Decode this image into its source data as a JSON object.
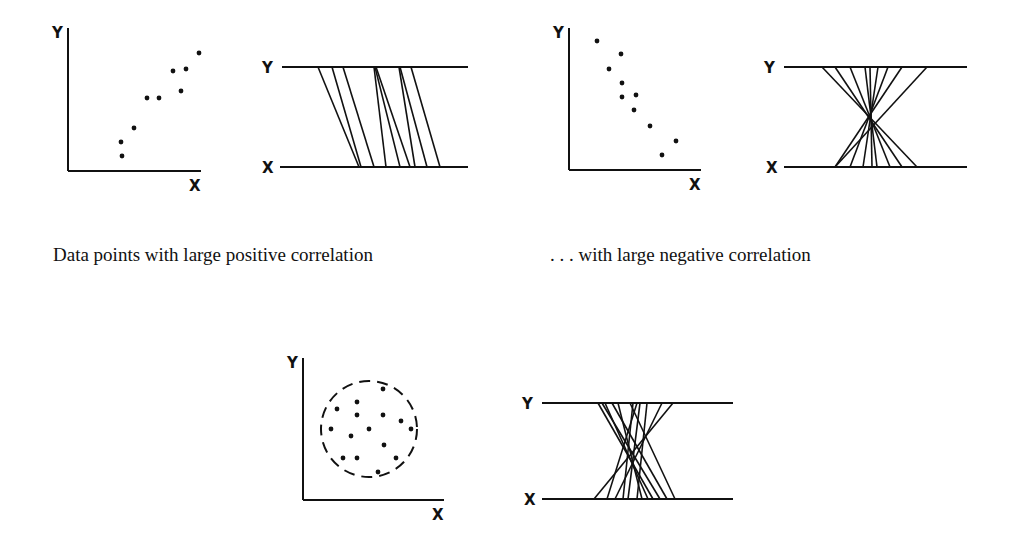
{
  "captions": {
    "positive": "Data points with large positive correlation",
    "negative": ". . . with large negative correlation"
  },
  "axis_labels": {
    "x": "X",
    "y": "Y"
  },
  "colors": {
    "ink": "#111111",
    "background": "#ffffff"
  },
  "panels": [
    {
      "id": "positive",
      "scatter": {
        "axis_origin": [
          68,
          171
        ],
        "y_top": 28,
        "x_right": 201,
        "points": [
          [
            121,
            142
          ],
          [
            122,
            156
          ],
          [
            134,
            128
          ],
          [
            147,
            98
          ],
          [
            159,
            98
          ],
          [
            173,
            71
          ],
          [
            186,
            69
          ],
          [
            181,
            91
          ],
          [
            199,
            53
          ]
        ]
      },
      "parallel": {
        "y_line": {
          "y": 67,
          "x1": 282,
          "x2": 468
        },
        "x_line": {
          "y": 167,
          "x1": 280,
          "x2": 468
        },
        "lines": [
          [
            318,
            359
          ],
          [
            332,
            361
          ],
          [
            343,
            374
          ],
          [
            374,
            386
          ],
          [
            376,
            410
          ],
          [
            375,
            400
          ],
          [
            399,
            415
          ],
          [
            400,
            427
          ],
          [
            411,
            440
          ]
        ]
      }
    },
    {
      "id": "negative",
      "scatter": {
        "axis_origin": [
          569,
          170
        ],
        "y_top": 28,
        "x_right": 701,
        "points": [
          [
            597,
            41
          ],
          [
            621,
            54
          ],
          [
            609,
            69
          ],
          [
            622,
            83
          ],
          [
            622,
            97
          ],
          [
            636,
            95
          ],
          [
            634,
            110
          ],
          [
            650,
            126
          ],
          [
            676,
            141
          ],
          [
            662,
            155
          ]
        ]
      },
      "parallel": {
        "y_line": {
          "y": 67,
          "x1": 784,
          "x2": 967
        },
        "x_line": {
          "y": 167,
          "x1": 784,
          "x2": 967
        },
        "lines": [
          [
            822,
            917
          ],
          [
            835,
            902
          ],
          [
            850,
            890
          ],
          [
            865,
            877
          ],
          [
            870,
            872
          ],
          [
            878,
            863
          ],
          [
            888,
            850
          ],
          [
            902,
            835
          ],
          [
            927,
            835
          ]
        ]
      }
    },
    {
      "id": "zero",
      "scatter": {
        "axis_origin": [
          303,
          500
        ],
        "y_top": 358,
        "x_right": 444,
        "circle": {
          "cx": 369,
          "cy": 429,
          "r": 48
        },
        "points": [
          [
            383,
            389
          ],
          [
            357,
            402
          ],
          [
            337,
            409
          ],
          [
            357,
            415
          ],
          [
            383,
            415
          ],
          [
            401,
            421
          ],
          [
            331,
            429
          ],
          [
            369,
            429
          ],
          [
            411,
            429
          ],
          [
            351,
            436
          ],
          [
            384,
            445
          ],
          [
            343,
            458
          ],
          [
            357,
            458
          ],
          [
            396,
            458
          ],
          [
            378,
            472
          ]
        ]
      },
      "parallel": {
        "y_line": {
          "y": 403,
          "x1": 542,
          "x2": 733
        },
        "x_line": {
          "y": 499,
          "x1": 542,
          "x2": 733
        },
        "lines": [
          [
            598,
            653
          ],
          [
            602,
            660
          ],
          [
            605,
            648
          ],
          [
            612,
            667
          ],
          [
            618,
            642
          ],
          [
            630,
            675
          ],
          [
            633,
            623
          ],
          [
            637,
            607
          ],
          [
            640,
            628
          ],
          [
            647,
            637
          ],
          [
            662,
            615
          ],
          [
            673,
            594
          ]
        ]
      }
    }
  ]
}
